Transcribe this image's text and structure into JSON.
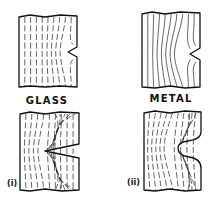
{
  "figure": {
    "panels": [
      {
        "id": "glass-top",
        "material": "glass",
        "notch": "sharp"
      },
      {
        "id": "metal-top",
        "material": "metal",
        "notch": "sharp"
      },
      {
        "id": "glass-bottom",
        "material": "glass",
        "notch": "sharp-deep",
        "label": "(i)"
      },
      {
        "id": "metal-bottom",
        "material": "metal",
        "notch": "rounded-deep",
        "label": "(ii)"
      }
    ],
    "captions": {
      "glass": "GLASS",
      "metal": "METAL"
    },
    "sub_labels": {
      "i": "(i)",
      "ii": "(ii)"
    },
    "colors": {
      "ink": "#111111",
      "background": "#ffffff"
    }
  }
}
